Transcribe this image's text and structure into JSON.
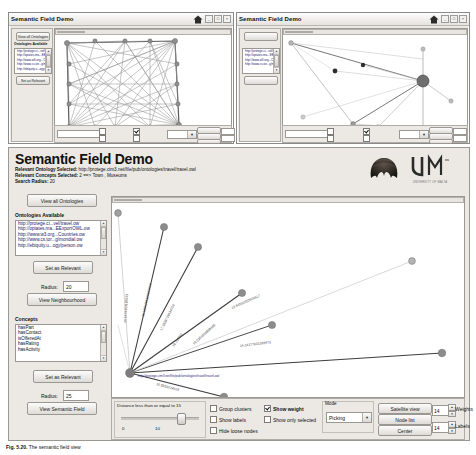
{
  "windows": {
    "left": {
      "title": "Semantic Field Demo"
    },
    "right": {
      "title": "Semantic Field Demo"
    }
  },
  "titlebar_buttons": [
    "_",
    "□",
    "×"
  ],
  "header": {
    "title": "Semantic Field Demo",
    "relevant_ontology_label": "Relevant Ontology Selected:",
    "relevant_ontology_value": "http://protege.cim3.net/file/pub/ontologies/travel/travel.owl",
    "relevant_concepts_label": "Relevant Concepts Selected:",
    "relevant_concepts_value": "2 ==> Town , Museums",
    "search_radius_label": "Search Radius:",
    "search_radius_value": "20",
    "logo_name": "um-logo",
    "logo_text": "UNIVERSITY OF MALTA",
    "artifact_name": "helmet-photo"
  },
  "left_panel": {
    "view_all_button": "View all Ontologies",
    "ontologies_header": "Ontologies Available",
    "ontologies": [
      "http://protege.ci...vel/travel.ow",
      "http://opiates.ma...EExportOWL.ow",
      "http://www.w3.org...Countries.ow",
      "http://www.cs.tor...g/mondial.ow",
      "http://ebiquity.u...ogy/person.ow"
    ],
    "set_relevant_button_1": "Set as Relevant",
    "radius_label_1": "Radius:",
    "radius_value_1": "20",
    "view_neighbourhood_button": "View Neighbourhood",
    "concepts_header": "Concepts",
    "concepts": [
      "hasPart",
      "hasContact",
      "isOfferedAt",
      "hasRating",
      "hasActivity"
    ],
    "set_relevant_button_2": "Set as Relevant",
    "radius_label_2": "Radius:",
    "radius_value_2": "25",
    "view_semantic_field_button": "View Semantic Field"
  },
  "controls": {
    "distance_label": "Distance less than or equal to 15",
    "slider_min": "0",
    "slider_max": "10",
    "slider_percent": 72,
    "checkboxes": [
      {
        "label": "Group clusters",
        "checked": false
      },
      {
        "label": "Show labels",
        "checked": false
      },
      {
        "label": "Hide loose nodes",
        "checked": false
      },
      {
        "label": "Show weight",
        "checked": true
      },
      {
        "label": "Show only selected",
        "checked": false
      }
    ],
    "mode_label": "Mode",
    "mode_value": "Picking",
    "buttons": [
      "Satellite view",
      "Node list",
      "Center"
    ],
    "weights_value": "14",
    "weights_label": "Weights",
    "labels_value": "14",
    "labels_label": "Labels"
  },
  "graph": {
    "hub_url": "http://protege.cim3.net/file/pub/ontologies/travel/travel.owl",
    "edge_labels": [
      "16.1424153186373",
      "15.1185268116620006",
      "17.3659728434024",
      "16.235511",
      "16.5361950808466",
      "18.64558353634517",
      "14.24177631339973",
      "16.5553224018"
    ]
  },
  "caption": {
    "prefix": "Fig. 5.20.",
    "text": "The semantic field view"
  }
}
